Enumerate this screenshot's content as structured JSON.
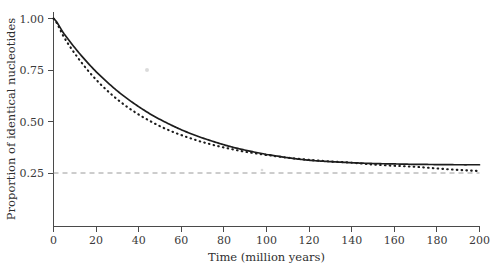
{
  "chart_data": {
    "type": "line",
    "title": "",
    "xlabel": "Time (million years)",
    "ylabel": "Proportion of identical nucleotides",
    "xlim": [
      0,
      200
    ],
    "ylim": [
      0,
      1.0
    ],
    "xticks": [
      0,
      20,
      40,
      60,
      80,
      100,
      120,
      140,
      160,
      180,
      200
    ],
    "xtick_labels": [
      "0",
      "20",
      "40",
      "60",
      "80",
      "100",
      "120",
      "140",
      "160",
      "180",
      "200"
    ],
    "yticks": [
      0.25,
      0.5,
      0.75,
      1.0
    ],
    "ytick_labels": [
      "0.25",
      "0.50",
      "0.75",
      "1.00"
    ],
    "grid": false,
    "legend": "none",
    "annotations": [
      {
        "name": "reference-line",
        "kind": "horizontal-dashed-line",
        "y": 0.25,
        "label": "0.25"
      }
    ],
    "x": [
      0,
      5,
      10,
      15,
      20,
      25,
      30,
      35,
      40,
      45,
      50,
      55,
      60,
      65,
      70,
      75,
      80,
      85,
      90,
      95,
      100,
      110,
      120,
      130,
      140,
      150,
      160,
      170,
      180,
      190,
      200
    ],
    "series": [
      {
        "name": "solid-curve",
        "style": "solid",
        "color": "#1d1d1d",
        "asymptote": 0.29,
        "values": [
          1.0,
          0.925,
          0.858,
          0.797,
          0.742,
          0.693,
          0.648,
          0.608,
          0.572,
          0.539,
          0.51,
          0.484,
          0.46,
          0.439,
          0.42,
          0.403,
          0.387,
          0.373,
          0.361,
          0.35,
          0.34,
          0.324,
          0.312,
          0.305,
          0.3,
          0.296,
          0.294,
          0.292,
          0.291,
          0.29,
          0.29
        ]
      },
      {
        "name": "dotted-curve",
        "style": "dotted",
        "color": "#1d1d1d",
        "asymptote": 0.25,
        "values": [
          1.0,
          0.908,
          0.83,
          0.762,
          0.703,
          0.652,
          0.607,
          0.568,
          0.534,
          0.504,
          0.477,
          0.454,
          0.434,
          0.416,
          0.4,
          0.386,
          0.374,
          0.363,
          0.353,
          0.345,
          0.337,
          0.324,
          0.314,
          0.306,
          0.3,
          0.291,
          0.285,
          0.28,
          0.272,
          0.265,
          0.26
        ]
      }
    ]
  },
  "specks": [
    {
      "name": "scan-speck-upper",
      "x": 147,
      "y": 70,
      "r": 2.0
    },
    {
      "name": "scan-speck-mid",
      "x": 262,
      "y": 170,
      "r": 1.3
    }
  ]
}
